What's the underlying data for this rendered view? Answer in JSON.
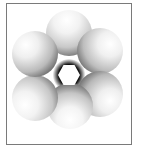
{
  "figure": {
    "frame_color": "#7a7a7a",
    "background_color": "#ffffff",
    "sphere_count": 6,
    "spheres": [
      {
        "position": "top",
        "cx": 69,
        "cy": 33,
        "r": 23
      },
      {
        "position": "upper-right",
        "cx": 100,
        "cy": 51,
        "r": 23
      },
      {
        "position": "lower-right",
        "cx": 100,
        "cy": 94,
        "r": 23
      },
      {
        "position": "bottom",
        "cx": 70,
        "cy": 106,
        "r": 23
      },
      {
        "position": "lower-left",
        "cx": 35,
        "cy": 98,
        "r": 23
      },
      {
        "position": "upper-left",
        "cx": 35,
        "cy": 54,
        "r": 23
      }
    ],
    "center_hole_shape": "hexagon"
  }
}
